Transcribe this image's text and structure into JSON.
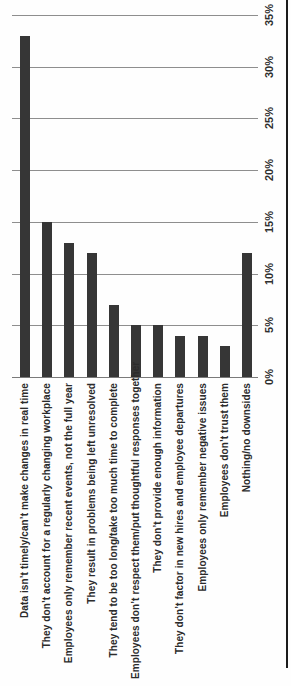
{
  "chart_data": {
    "type": "bar",
    "title": "",
    "xlabel": "",
    "ylabel": "",
    "orientation": "column-chart rotated 90deg CCW on page; all text reads bottom-to-top",
    "categories": [
      "Data isn’t timely/can’t make changes in real time",
      "They don’t account for a regularly changing workplace",
      "Employees only remember recent events, not the full year",
      "They result in problems being left unresolved",
      "They tend to be too long/take too much time to complete",
      "Employees don’t respect them/put thoughtful responses together",
      "They don’t provide enough information",
      "They don’t factor in new hires and employee departures",
      "Employees only remember negative issues",
      "Employees don’t trust them",
      "Nothing/no downsides"
    ],
    "values": [
      33,
      15,
      13,
      12,
      7,
      5,
      5,
      4,
      4,
      3,
      12
    ],
    "value_unit": "%",
    "value_axis": {
      "tick_values": [
        0,
        5,
        10,
        15,
        20,
        25,
        30,
        35
      ],
      "tick_labels": [
        "0%",
        "5%",
        "10%",
        "15%",
        "20%",
        "25%",
        "30%",
        "35%"
      ],
      "min": 0,
      "max": 35
    },
    "grid": true,
    "legend": "none",
    "colors": {
      "bar": "#363636",
      "gridline": "#8e8e8e",
      "baseline": "#7a7a7a",
      "axis_border": "#1c1c1c",
      "text": "#2b2b2b",
      "background": "#fefefe"
    }
  }
}
